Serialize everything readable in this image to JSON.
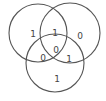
{
  "diagram": {
    "type": "venn-3",
    "stroke_color": "#555555",
    "text_color": "#444444",
    "circles": [
      {
        "id": "top-left",
        "cx": 38,
        "cy": 33,
        "r": 29
      },
      {
        "id": "top-right",
        "cx": 70,
        "cy": 33,
        "r": 30
      },
      {
        "id": "bottom",
        "cx": 55,
        "cy": 63,
        "r": 29
      }
    ],
    "regions": {
      "top_left_only": {
        "value": "1",
        "x": 33,
        "y": 34
      },
      "top_left_top_right": {
        "value": "1",
        "x": 55,
        "y": 33
      },
      "top_right_only": {
        "value": "0",
        "x": 80,
        "y": 36
      },
      "all_three": {
        "value": "0",
        "x": 56,
        "y": 50
      },
      "top_left_bottom": {
        "value": "0",
        "x": 43,
        "y": 58
      },
      "top_right_bottom": {
        "value": "1",
        "x": 69,
        "y": 59
      },
      "bottom_only": {
        "value": "1",
        "x": 57,
        "y": 79
      }
    }
  }
}
